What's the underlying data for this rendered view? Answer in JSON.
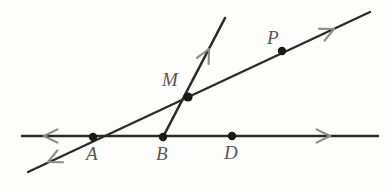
{
  "figure": {
    "type": "geometry-diagram",
    "width": 390,
    "height": 194,
    "background_color": "#fdfdfc",
    "line_color": "#2b2b2b",
    "arrow_color": "#8a8a8a",
    "point_color": "#1a1a1a",
    "label_color": "#575757"
  },
  "points": [
    {
      "id": "A",
      "label": "A",
      "x": 93,
      "y": 137,
      "label_x": 86,
      "label_y": 144,
      "dot_radius": 4.2,
      "on": [
        "horizontal-line",
        "diagonal-line"
      ]
    },
    {
      "id": "B",
      "label": "B",
      "x": 163,
      "y": 137,
      "label_x": 156,
      "label_y": 144,
      "dot_radius": 4.2,
      "on": [
        "horizontal-line",
        "steep-ray"
      ]
    },
    {
      "id": "D",
      "label": "D",
      "x": 232,
      "y": 136,
      "label_x": 224,
      "label_y": 143,
      "dot_radius": 4.2,
      "on": [
        "horizontal-line"
      ]
    },
    {
      "id": "M",
      "label": "M",
      "x": 188,
      "y": 97,
      "label_x": 162,
      "label_y": 70,
      "dot_radius": 4.6,
      "on": [
        "diagonal-line",
        "steep-ray"
      ]
    },
    {
      "id": "P",
      "label": "P",
      "x": 282,
      "y": 51,
      "label_x": 267,
      "label_y": 28,
      "dot_radius": 4.2,
      "on": [
        "diagonal-line"
      ]
    }
  ],
  "lines": [
    {
      "id": "horizontal-line",
      "name": "horizontal-line-through-A-B-D",
      "x1": 22,
      "y1": 136,
      "x2": 378,
      "y2": 136,
      "stroke_width": 2.4,
      "arrows": [
        "start",
        "end"
      ],
      "passes_through": [
        "A",
        "B",
        "D"
      ]
    },
    {
      "id": "diagonal-line",
      "name": "diagonal-line-through-A-M-P",
      "x1": 28,
      "y1": 172,
      "x2": 370,
      "y2": 12,
      "stroke_width": 2.4,
      "arrows": [
        "start",
        "end"
      ],
      "passes_through": [
        "A",
        "M",
        "P"
      ]
    },
    {
      "id": "steep-ray",
      "name": "steep-ray-from-B-through-M",
      "x1": 163,
      "y1": 137,
      "x2": 225,
      "y2": 18,
      "stroke_width": 2.6,
      "arrows": [
        "end"
      ],
      "passes_through": [
        "B",
        "M"
      ]
    }
  ],
  "arrowheads": [
    {
      "id": "arrow-horizontal-left",
      "x": 44,
      "y": 136,
      "angle_deg": 180,
      "size": 15
    },
    {
      "id": "arrow-horizontal-right",
      "x": 330,
      "y": 136,
      "angle_deg": 0,
      "size": 15
    },
    {
      "id": "arrow-diagonal-lower-left",
      "x": 48,
      "y": 162,
      "angle_deg": 155,
      "size": 15
    },
    {
      "id": "arrow-diagonal-upper-right",
      "x": 334,
      "y": 29,
      "angle_deg": -25,
      "size": 15
    },
    {
      "id": "arrow-steep-ray-top",
      "x": 209,
      "y": 49,
      "angle_deg": -62.5,
      "size": 15
    }
  ]
}
